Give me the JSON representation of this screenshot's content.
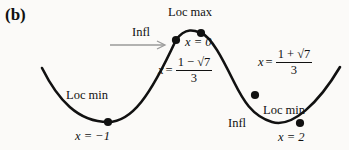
{
  "figure": {
    "panel_label": "(b)",
    "type": "calculus-curve-annotated",
    "background_color": "#fbfaf8",
    "curve_color": "#111111",
    "arrow_color": "#9a9a9a",
    "labels": {
      "loc_max": "Loc max",
      "loc_min_left": "Loc min",
      "loc_min_right": "Loc min",
      "infl_left": "Infl",
      "infl_right": "Infl",
      "x_at_loc_max": "x = 0",
      "x_at_loc_min_left": "x = −1",
      "x_at_loc_min_right": "x = 2"
    },
    "expressions": {
      "infl_left": {
        "lead": "x",
        "equals": "=",
        "numerator": "1 − √7",
        "denominator": "3"
      },
      "infl_right": {
        "lead": "x",
        "equals": "=",
        "numerator": "1 + √7",
        "denominator": "3"
      }
    },
    "points": [
      {
        "name": "local-minimum-left",
        "label": "Loc min",
        "x_value": "x = −1"
      },
      {
        "name": "inflection-left",
        "label": "Infl",
        "x_value": "x = (1 − √7)/3"
      },
      {
        "name": "local-maximum",
        "label": "Loc max",
        "x_value": "x = 0"
      },
      {
        "name": "inflection-right",
        "label": "Infl",
        "x_value": "x = (1 + √7)/3"
      },
      {
        "name": "local-minimum-right",
        "label": "Loc min",
        "x_value": "x = 2"
      }
    ]
  }
}
